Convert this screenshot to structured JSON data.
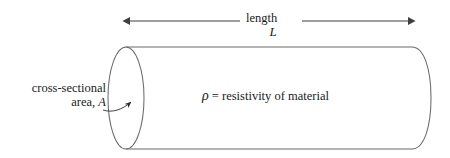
{
  "figure": {
    "background_color": "#ffffff",
    "line_color": "#3f3f3f",
    "text_color": "#1b1b1b",
    "dimension": {
      "label": "length",
      "symbol": "L",
      "arrow_style": "double-headed"
    },
    "callout": {
      "line1": "cross-sectional",
      "line2_prefix": "area, ",
      "line2_symbol": "A",
      "leader": "curved-arrow-to-cylinder-end-face"
    },
    "body_label": {
      "symbol": "ρ",
      "text": " = resistivity of material"
    },
    "shape": {
      "kind": "cylinder",
      "end_cap": "ellipse",
      "ellipse_cx": 126,
      "ellipse_cy": 98,
      "ellipse_rx": 18,
      "ellipse_ry": 51
    }
  }
}
